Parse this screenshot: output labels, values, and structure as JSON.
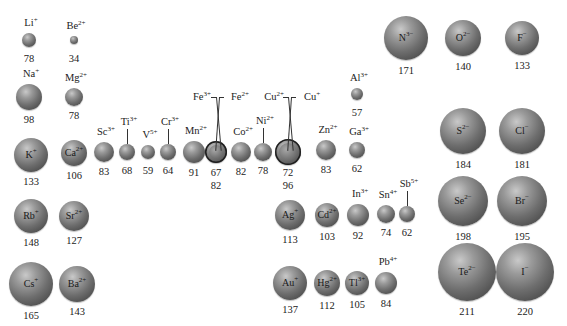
{
  "diagram": {
    "title": "",
    "unit": "pm",
    "cations": [
      {
        "symbol": "Li",
        "charge": "+",
        "radius": 78,
        "cx": 29,
        "cy": 40,
        "r": 7,
        "label": "above"
      },
      {
        "symbol": "Be",
        "charge": "2+",
        "radius": 34,
        "cx": 74,
        "cy": 40,
        "r": 4,
        "label": "above"
      },
      {
        "symbol": "Na",
        "charge": "+",
        "radius": 98,
        "cx": 29,
        "cy": 97,
        "r": 13,
        "label": "above"
      },
      {
        "symbol": "Mg",
        "charge": "2+",
        "radius": 78,
        "cx": 74,
        "cy": 97,
        "r": 9,
        "label": "above"
      },
      {
        "symbol": "K",
        "charge": "+",
        "radius": 133,
        "cx": 31,
        "cy": 155,
        "r": 17,
        "label": "inside"
      },
      {
        "symbol": "Ca",
        "charge": "2+",
        "radius": 106,
        "cx": 74,
        "cy": 153,
        "r": 13,
        "label": "inside"
      },
      {
        "symbol": "Sc",
        "charge": "3+",
        "radius": 83,
        "cx": 104,
        "cy": 152,
        "r": 10,
        "label": "above"
      },
      {
        "symbol": "Ti",
        "charge": "3+",
        "radius": 68,
        "cx": 127,
        "cy": 152,
        "r": 8,
        "label": "above-tick"
      },
      {
        "symbol": "V",
        "charge": "5+",
        "radius": 59,
        "cx": 148,
        "cy": 152,
        "r": 7,
        "label": "above"
      },
      {
        "symbol": "Cr",
        "charge": "3+",
        "radius": 64,
        "cx": 168,
        "cy": 152,
        "r": 8,
        "label": "above-tick"
      },
      {
        "symbol": "Mn",
        "charge": "2+",
        "radius": 91,
        "cx": 194,
        "cy": 152,
        "r": 11,
        "label": "above"
      },
      {
        "symbol": "Co",
        "charge": "2+",
        "radius": 82,
        "cx": 241,
        "cy": 152,
        "r": 10,
        "label": "above"
      },
      {
        "symbol": "Ni",
        "charge": "2+",
        "radius": 78,
        "cx": 263,
        "cy": 152,
        "r": 9,
        "label": "above-tick"
      },
      {
        "symbol": "Zn",
        "charge": "2+",
        "radius": 83,
        "cx": 326,
        "cy": 150,
        "r": 10,
        "label": "above"
      },
      {
        "symbol": "Ga",
        "charge": "3+",
        "radius": 62,
        "cx": 357,
        "cy": 150,
        "r": 8,
        "label": "above"
      },
      {
        "symbol": "Al",
        "charge": "3+",
        "radius": 57,
        "cx": 357,
        "cy": 94,
        "r": 6,
        "label": "above"
      },
      {
        "symbol": "Rb",
        "charge": "+",
        "radius": 148,
        "cx": 31,
        "cy": 216,
        "r": 17,
        "label": "inside"
      },
      {
        "symbol": "Sr",
        "charge": "2+",
        "radius": 127,
        "cx": 74,
        "cy": 216,
        "r": 15,
        "label": "inside"
      },
      {
        "symbol": "Cs",
        "charge": "+",
        "radius": 165,
        "cx": 31,
        "cy": 284,
        "r": 22,
        "label": "inside"
      },
      {
        "symbol": "Ba",
        "charge": "2+",
        "radius": 143,
        "cx": 77,
        "cy": 284,
        "r": 18,
        "label": "inside"
      },
      {
        "symbol": "Ag",
        "charge": "+",
        "radius": 113,
        "cx": 290,
        "cy": 215,
        "r": 15,
        "label": "inside"
      },
      {
        "symbol": "Cd",
        "charge": "2+",
        "radius": 103,
        "cx": 327,
        "cy": 215,
        "r": 12,
        "label": "inside"
      },
      {
        "symbol": "In",
        "charge": "3+",
        "radius": 92,
        "cx": 358,
        "cy": 215,
        "r": 11,
        "label": "above"
      },
      {
        "symbol": "Sn",
        "charge": "4+",
        "radius": 74,
        "cx": 386,
        "cy": 214,
        "r": 9,
        "label": "above"
      },
      {
        "symbol": "Sb",
        "charge": "5+",
        "radius": 62,
        "cx": 407,
        "cy": 214,
        "r": 8,
        "label": "above-tick"
      },
      {
        "symbol": "Au",
        "charge": "+",
        "radius": 137,
        "cx": 290,
        "cy": 283,
        "r": 17,
        "label": "inside"
      },
      {
        "symbol": "Hg",
        "charge": "2+",
        "radius": 112,
        "cx": 327,
        "cy": 283,
        "r": 13,
        "label": "inside"
      },
      {
        "symbol": "Tl",
        "charge": "3+",
        "radius": 105,
        "cx": 357,
        "cy": 283,
        "r": 12,
        "label": "inside"
      },
      {
        "symbol": "Pb",
        "charge": "4+",
        "radius": 84,
        "cx": 386,
        "cy": 283,
        "r": 11,
        "label": "above"
      }
    ],
    "paired": [
      {
        "cx": 216,
        "cy": 152,
        "r": 11,
        "inner_r": 7,
        "ions": [
          {
            "symbol": "Fe",
            "charge": "3+",
            "radius": 67
          },
          {
            "symbol": "Fe",
            "charge": "2+",
            "radius": 82
          }
        ],
        "values": [
          "67",
          "82"
        ]
      },
      {
        "cx": 288,
        "cy": 152,
        "r": 13,
        "inner_r": 9,
        "ions": [
          {
            "symbol": "Cu",
            "charge": "2+",
            "radius": 72
          },
          {
            "symbol": "Cu",
            "charge": "+",
            "radius": 96
          }
        ],
        "values": [
          "72",
          "96"
        ]
      }
    ],
    "anions": [
      {
        "symbol": "N",
        "charge": "3−",
        "radius": 171,
        "cx": 406,
        "cy": 38,
        "r": 22
      },
      {
        "symbol": "O",
        "charge": "2−",
        "radius": 140,
        "cx": 463,
        "cy": 38,
        "r": 18
      },
      {
        "symbol": "F",
        "charge": "−",
        "radius": 133,
        "cx": 522,
        "cy": 38,
        "r": 17
      },
      {
        "symbol": "S",
        "charge": "2−",
        "radius": 184,
        "cx": 463,
        "cy": 131,
        "r": 23
      },
      {
        "symbol": "Cl",
        "charge": "−",
        "radius": 181,
        "cx": 522,
        "cy": 131,
        "r": 23
      },
      {
        "symbol": "Se",
        "charge": "2−",
        "radius": 198,
        "cx": 463,
        "cy": 201,
        "r": 25
      },
      {
        "symbol": "Br",
        "charge": "−",
        "radius": 195,
        "cx": 522,
        "cy": 201,
        "r": 25
      },
      {
        "symbol": "Te",
        "charge": "2−",
        "radius": 211,
        "cx": 467,
        "cy": 272,
        "r": 29
      },
      {
        "symbol": "I",
        "charge": "−",
        "radius": 220,
        "cx": 525,
        "cy": 272,
        "r": 29
      }
    ]
  }
}
